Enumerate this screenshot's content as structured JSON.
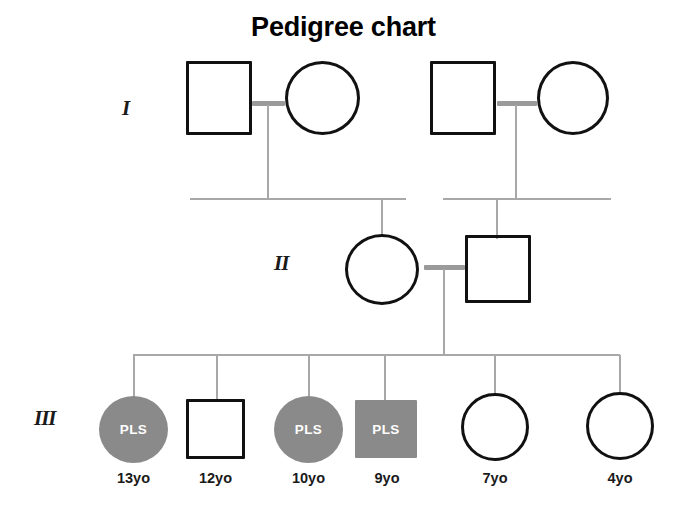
{
  "title": "Pedigree chart",
  "colors": {
    "affected_fill": "#8a8a8a",
    "unaffected_fill": "#ffffff",
    "outline": "#111111",
    "line": "#a8a8a8",
    "affected_text": "#ffffff",
    "label_text": "#1a1a1a"
  },
  "legend_symbols": {
    "square": "male",
    "circle": "female",
    "filled": "affected",
    "open": "unaffected"
  },
  "generations": [
    {
      "id": "I",
      "label": "I",
      "members": [
        {
          "id": "I-1",
          "sex": "male",
          "shape": "square",
          "affected": false,
          "status_text": "",
          "age_label": ""
        },
        {
          "id": "I-2",
          "sex": "female",
          "shape": "circle",
          "affected": false,
          "status_text": "",
          "age_label": ""
        },
        {
          "id": "I-3",
          "sex": "male",
          "shape": "square",
          "affected": false,
          "status_text": "",
          "age_label": ""
        },
        {
          "id": "I-4",
          "sex": "female",
          "shape": "circle",
          "affected": false,
          "status_text": "",
          "age_label": ""
        }
      ],
      "couples": [
        {
          "partners": [
            "I-1",
            "I-2"
          ]
        },
        {
          "partners": [
            "I-3",
            "I-4"
          ]
        }
      ]
    },
    {
      "id": "II",
      "label": "II",
      "members": [
        {
          "id": "II-1",
          "sex": "female",
          "shape": "circle",
          "affected": false,
          "status_text": "",
          "age_label": ""
        },
        {
          "id": "II-2",
          "sex": "male",
          "shape": "square",
          "affected": false,
          "status_text": "",
          "age_label": ""
        }
      ],
      "couples": [
        {
          "partners": [
            "II-1",
            "II-2"
          ]
        }
      ]
    },
    {
      "id": "III",
      "label": "III",
      "members": [
        {
          "id": "III-1",
          "sex": "female",
          "shape": "circle",
          "affected": true,
          "status_text": "PLS",
          "age_label": "13yo"
        },
        {
          "id": "III-2",
          "sex": "male",
          "shape": "square",
          "affected": false,
          "status_text": "",
          "age_label": "12yo"
        },
        {
          "id": "III-3",
          "sex": "female",
          "shape": "circle",
          "affected": true,
          "status_text": "PLS",
          "age_label": "10yo"
        },
        {
          "id": "III-4",
          "sex": "male",
          "shape": "square",
          "affected": true,
          "status_text": "PLS",
          "age_label": "9yo"
        },
        {
          "id": "III-5",
          "sex": "female",
          "shape": "circle",
          "affected": false,
          "status_text": "",
          "age_label": "7yo"
        },
        {
          "id": "III-6",
          "sex": "female",
          "shape": "circle",
          "affected": false,
          "status_text": "",
          "age_label": "4yo"
        }
      ],
      "couples": []
    }
  ],
  "affected_count": 3,
  "total_individuals": 12,
  "disease_code": "PLS"
}
